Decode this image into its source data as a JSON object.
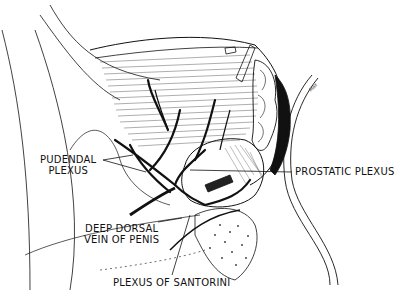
{
  "figure": {
    "type": "anatomical line illustration",
    "colors": {
      "ink": "#111111",
      "background": "#ffffff"
    }
  },
  "labels": {
    "pudendal_plexus": {
      "line1": "PUDENDAL",
      "line2": "PLEXUS"
    },
    "prostatic_plexus": "PROSTATIC PLEXUS",
    "deep_dorsal_vein": {
      "line1": "DEEP DORSAL",
      "line2": "VEIN OF PENIS"
    },
    "plexus_of_santorini": "PLEXUS OF SANTORINI"
  },
  "signature": "Max"
}
